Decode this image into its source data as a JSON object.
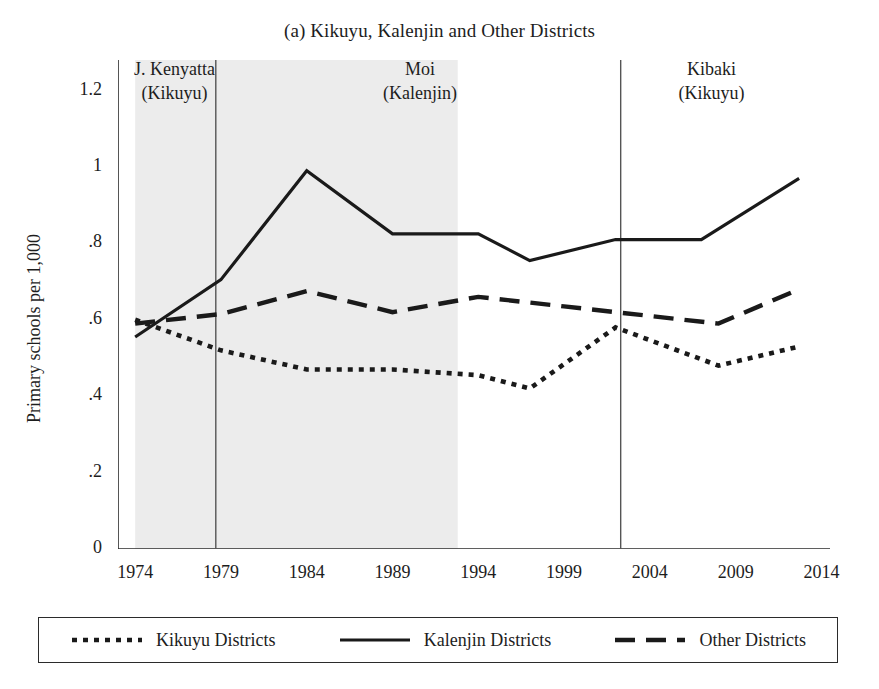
{
  "chart_data": {
    "type": "line",
    "title": "(a) Kikuyu, Kalenjin and Other Districts",
    "xlabel": "",
    "ylabel": "Primary schools per 1,000",
    "xlim": [
      1973.0,
      2014.5
    ],
    "ylim": [
      0,
      1.28
    ],
    "grid": false,
    "legend_position": "bottom",
    "xticks": [
      1974,
      1979,
      1984,
      1989,
      1994,
      1999,
      2004,
      2009,
      2014
    ],
    "xtick_labels": [
      "1974",
      "1979",
      "1984",
      "1989",
      "1994",
      "1999",
      "2004",
      "2009",
      "2014"
    ],
    "yticks": [
      0,
      0.2,
      0.4,
      0.6,
      0.8,
      1,
      1.2
    ],
    "ytick_labels": [
      "0",
      ".2",
      ".4",
      ".6",
      ".8",
      "1",
      "1.2"
    ],
    "series": [
      {
        "name": "Kikuyu Districts",
        "style": "dotted",
        "x": [
          1974,
          1979,
          1984,
          1989,
          1994,
          1997,
          2002,
          2008,
          2012.7
        ],
        "values": [
          0.6,
          0.52,
          0.47,
          0.47,
          0.455,
          0.42,
          0.58,
          0.48,
          0.53
        ]
      },
      {
        "name": "Kalenjin Districts",
        "style": "solid",
        "x": [
          1974,
          1979,
          1984,
          1989,
          1994,
          1997,
          2002,
          2007,
          2012.7
        ],
        "values": [
          0.555,
          0.705,
          0.99,
          0.825,
          0.825,
          0.755,
          0.81,
          0.81,
          0.97
        ]
      },
      {
        "name": "Other Districts",
        "style": "dashed",
        "x": [
          1974,
          1979,
          1984,
          1989,
          1994,
          1999,
          2002,
          2008,
          2012.7
        ],
        "values": [
          0.59,
          0.615,
          0.675,
          0.62,
          0.66,
          0.635,
          0.62,
          0.59,
          0.68
        ]
      }
    ],
    "shaded_region": {
      "start": 1974,
      "end": 1992.8,
      "color": "#ececec"
    },
    "vertical_rules": [
      1978.7,
      2002.3
    ],
    "annotations": [
      {
        "name": "kenyatta",
        "line1": "J. Kenyatta",
        "line2": "(Kikuyu)",
        "x": 1976.3
      },
      {
        "name": "moi",
        "line1": "Moi",
        "line2": "(Kalenjin)",
        "x": 1990.6
      },
      {
        "name": "kibaki",
        "line1": "Kibaki",
        "line2": "(Kikuyu)",
        "x": 2007.6
      }
    ]
  },
  "legend": {
    "items": [
      {
        "label": "Kikuyu Districts",
        "style": "dotted"
      },
      {
        "label": "Kalenjin Districts",
        "style": "solid"
      },
      {
        "label": "Other Districts",
        "style": "dashed"
      }
    ]
  },
  "colors": {
    "line": "#1a1a1a",
    "shading": "#ececec",
    "axis": "#2b2b2b",
    "background": "#ffffff"
  }
}
